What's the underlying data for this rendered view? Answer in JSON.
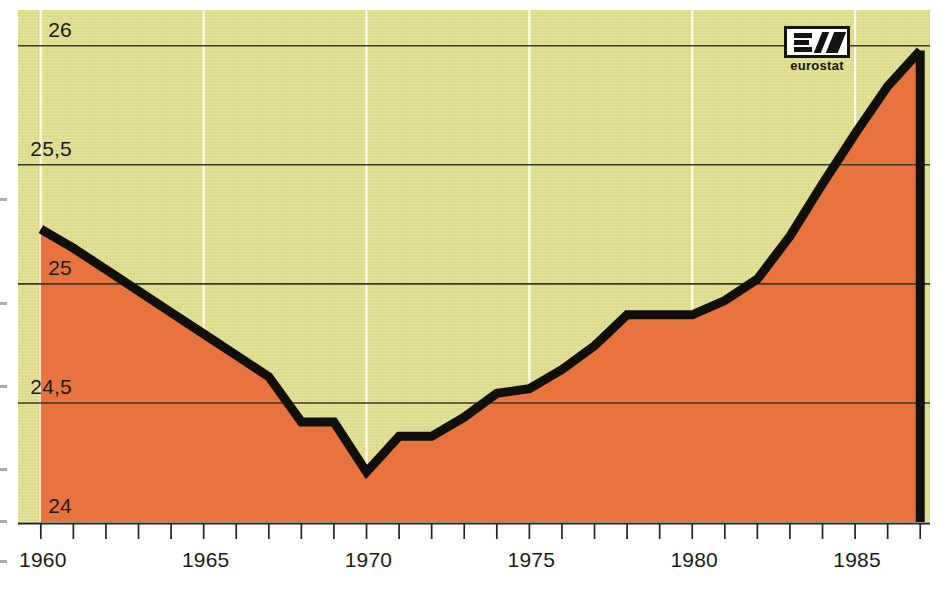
{
  "chart_data": {
    "type": "area",
    "title": "",
    "subtitle": "",
    "xlabel": "",
    "ylabel": "",
    "xlim": [
      1959.3,
      1987.3
    ],
    "ylim": [
      24,
      26.15
    ],
    "grid": "horizontal gridlines at each y tick; white vertical gridlines every 5 years",
    "legend": "none",
    "y_ticks": [
      "24",
      "24,5",
      "25",
      "25,5",
      "26"
    ],
    "y_tick_values": [
      24,
      24.5,
      25,
      25.5,
      26
    ],
    "x_ticks": [
      "1960",
      "1965",
      "1970",
      "1975",
      "1980",
      "1985"
    ],
    "x_tick_values": [
      1960,
      1965,
      1970,
      1975,
      1980,
      1985
    ],
    "x_minor_tick_step": 1,
    "series": [
      {
        "name": "series-1",
        "x": [
          1960,
          1961,
          1962,
          1963,
          1964,
          1965,
          1966,
          1967,
          1968,
          1969,
          1970,
          1971,
          1972,
          1973,
          1974,
          1975,
          1976,
          1977,
          1978,
          1979,
          1980,
          1981,
          1982,
          1983,
          1984,
          1985,
          1986,
          1987
        ],
        "values": [
          25.23,
          25.15,
          25.06,
          24.97,
          24.88,
          24.79,
          24.7,
          24.61,
          24.42,
          24.42,
          24.21,
          24.36,
          24.36,
          24.44,
          24.54,
          24.56,
          24.64,
          24.74,
          24.87,
          24.87,
          24.87,
          24.93,
          25.02,
          25.2,
          25.42,
          25.63,
          25.83,
          25.98
        ]
      }
    ],
    "annotations": []
  },
  "axes": {
    "y_labels": [
      {
        "text": "26",
        "value": 26
      },
      {
        "text": "25,5",
        "value": 25.5
      },
      {
        "text": "25",
        "value": 25
      },
      {
        "text": "24,5",
        "value": 24.5
      },
      {
        "text": "24",
        "value": 24
      }
    ],
    "x_labels": [
      {
        "text": "1960",
        "value": 1960
      },
      {
        "text": "1965",
        "value": 1965
      },
      {
        "text": "1970",
        "value": 1970
      },
      {
        "text": "1975",
        "value": 1975
      },
      {
        "text": "1980",
        "value": 1980
      },
      {
        "text": "1985",
        "value": 1985
      }
    ]
  },
  "logo": {
    "name": "eurostat-logo",
    "wordmark": "eurostat"
  },
  "colors": {
    "area_fill": "#e8733f",
    "plot_background": "#e4e292",
    "line": "#100f0c",
    "gridline": "#3a3a2a",
    "vertical_gridline": "#fbfbe8",
    "text": "#1b1b18",
    "page_background": "#ffffff"
  }
}
